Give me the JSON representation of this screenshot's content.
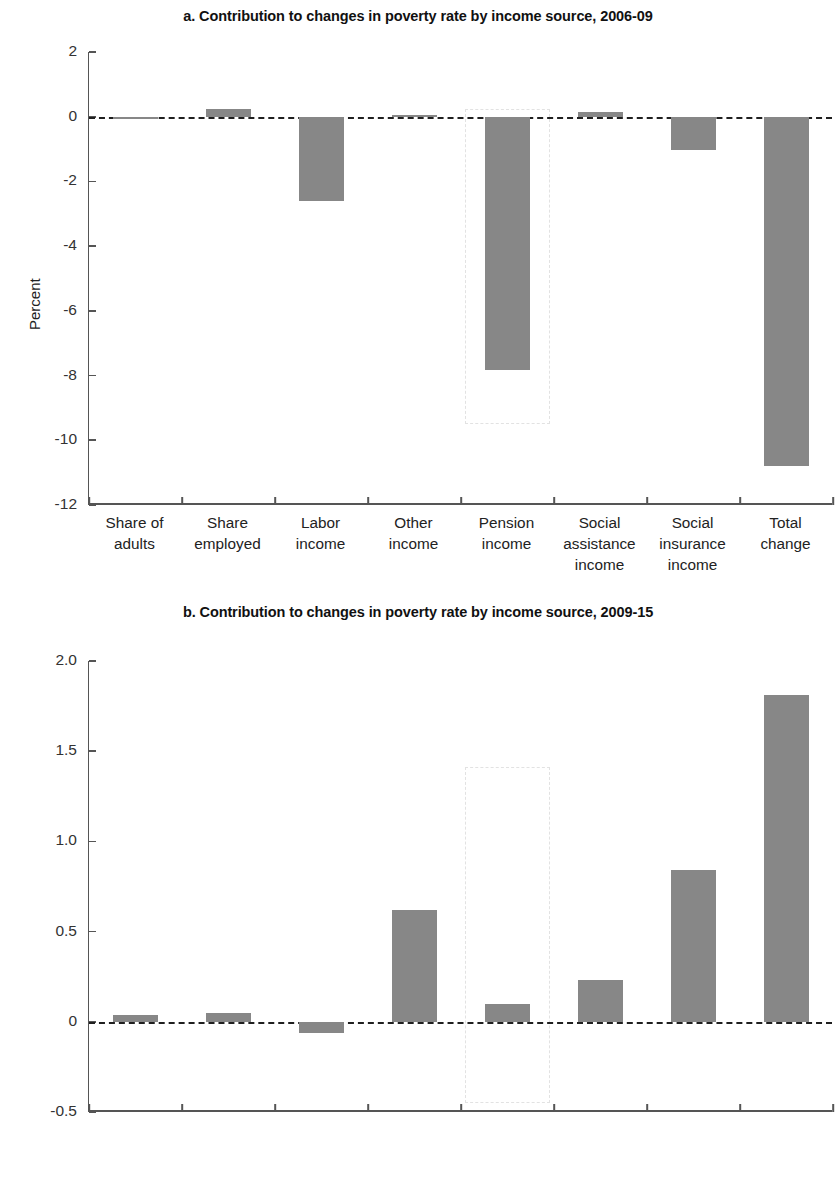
{
  "chart_data": [
    {
      "type": "bar",
      "panel": "a",
      "title": "a. Contribution to changes in poverty rate by income source, 2006-09",
      "xlabel": "",
      "ylabel": "Percent",
      "ylim": [
        -12,
        2
      ],
      "yticks": [
        "2",
        "0",
        "-2",
        "-4",
        "-6",
        "-8",
        "-10",
        "-12"
      ],
      "ytick_values": [
        2,
        0,
        -2,
        -4,
        -6,
        -8,
        -10,
        -12
      ],
      "grid": false,
      "legend": "none",
      "zero_reference_line": true,
      "categories": [
        "Share of adults",
        "Share employed",
        "Labor income",
        "Other income",
        "Pension income",
        "Social assistance income",
        "Social insurance income",
        "Total change"
      ],
      "values": [
        -0.08,
        0.25,
        -2.6,
        0.05,
        -7.83,
        0.15,
        -1.02,
        -10.8
      ],
      "highlight": {
        "category": "Pension income",
        "from": 0.25,
        "to": -9.5
      }
    },
    {
      "type": "bar",
      "panel": "b",
      "title": "b. Contribution to changes in poverty rate by income source, 2009-15",
      "xlabel": "",
      "ylabel": "Percent",
      "ylim": [
        -0.5,
        2.0
      ],
      "yticks": [
        "2.0",
        "1.5",
        "1.0",
        "0.5",
        "0",
        "-0.5"
      ],
      "ytick_values": [
        2.0,
        1.5,
        1.0,
        0.5,
        0,
        -0.5
      ],
      "grid": false,
      "legend": "none",
      "zero_reference_line": true,
      "categories": [
        "Share of adults",
        "Share employed",
        "Labor income",
        "Other income",
        "Pension income",
        "Social assistance income",
        "Social insurance income",
        "Total change"
      ],
      "values": [
        0.04,
        0.05,
        -0.06,
        0.62,
        0.1,
        0.23,
        0.84,
        1.81
      ],
      "highlight": {
        "category": "Pension income",
        "from": 1.41,
        "to": -0.45
      }
    }
  ],
  "panel_a": {
    "title": "a. Contribution to changes in poverty rate by income source, 2006-09",
    "ylabel": "Percent"
  },
  "panel_b": {
    "title": "b. Contribution to changes in poverty rate by income source, 2009-15",
    "ylabel": "Percent"
  },
  "category_lines": [
    [
      "Share of",
      "adults"
    ],
    [
      "Share",
      "employed"
    ],
    [
      "Labor",
      "income"
    ],
    [
      "Other",
      "income"
    ],
    [
      "Pension",
      "income"
    ],
    [
      "Social",
      "assistance",
      "income"
    ],
    [
      "Social",
      "insurance",
      "income"
    ],
    [
      "Total",
      "change"
    ]
  ]
}
